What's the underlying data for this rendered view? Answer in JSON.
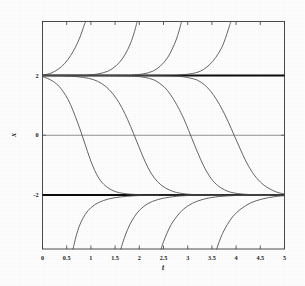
{
  "chart_data": {
    "type": "line",
    "title": "",
    "xlabel": "t",
    "ylabel": "x",
    "xlim": [
      0,
      5
    ],
    "ylim": [
      -3.8,
      3.8
    ],
    "grid": false,
    "legend": "none",
    "x_ticks": [
      0,
      0.5,
      1,
      1.5,
      2,
      2.5,
      3,
      3.5,
      4,
      4.5,
      5
    ],
    "x_tick_labels": [
      "0",
      "0.5",
      "1",
      "1.5",
      "2",
      "2.5",
      "3",
      "3.5",
      "4",
      "4.5",
      "5"
    ],
    "y_ticks": [
      2,
      0,
      -2
    ],
    "y_tick_labels": [
      "2",
      "0",
      "-2"
    ],
    "annotations": [
      {
        "name": "upper-asymptote",
        "y": 2,
        "style": "thick-solid"
      },
      {
        "name": "lower-asymptote",
        "y": -2,
        "style": "thick-solid"
      },
      {
        "name": "zero-axis",
        "y": 0,
        "style": "thin-solid"
      }
    ],
    "series": [
      {
        "name": "descending-sigmoid-1",
        "region": "between-asymptotes",
        "points": [
          [
            0.0,
            1.96
          ],
          [
            0.1,
            1.9
          ],
          [
            0.22,
            1.8
          ],
          [
            0.35,
            1.62
          ],
          [
            0.48,
            1.33
          ],
          [
            0.58,
            1.02
          ],
          [
            0.68,
            0.62
          ],
          [
            0.78,
            0.18
          ],
          [
            0.88,
            -0.3
          ],
          [
            0.98,
            -0.78
          ],
          [
            1.08,
            -1.18
          ],
          [
            1.2,
            -1.52
          ],
          [
            1.34,
            -1.74
          ],
          [
            1.5,
            -1.88
          ],
          [
            1.7,
            -1.95
          ],
          [
            1.95,
            -1.98
          ],
          [
            2.3,
            -2.0
          ],
          [
            3.0,
            -2.0
          ],
          [
            5.0,
            -2.0
          ]
        ]
      },
      {
        "name": "descending-sigmoid-2",
        "region": "between-asymptotes",
        "points": [
          [
            0.0,
            2.0
          ],
          [
            0.3,
            1.99
          ],
          [
            0.6,
            1.97
          ],
          [
            0.85,
            1.93
          ],
          [
            1.05,
            1.86
          ],
          [
            1.22,
            1.73
          ],
          [
            1.38,
            1.52
          ],
          [
            1.52,
            1.24
          ],
          [
            1.64,
            0.92
          ],
          [
            1.76,
            0.52
          ],
          [
            1.88,
            0.06
          ],
          [
            2.0,
            -0.42
          ],
          [
            2.12,
            -0.88
          ],
          [
            2.24,
            -1.26
          ],
          [
            2.38,
            -1.56
          ],
          [
            2.54,
            -1.76
          ],
          [
            2.72,
            -1.89
          ],
          [
            2.95,
            -1.96
          ],
          [
            3.25,
            -1.99
          ],
          [
            3.8,
            -2.0
          ],
          [
            5.0,
            -2.0
          ]
        ]
      },
      {
        "name": "descending-sigmoid-3",
        "region": "between-asymptotes",
        "points": [
          [
            0.0,
            2.0
          ],
          [
            0.8,
            2.0
          ],
          [
            1.5,
            1.99
          ],
          [
            1.9,
            1.97
          ],
          [
            2.12,
            1.93
          ],
          [
            2.3,
            1.85
          ],
          [
            2.45,
            1.7
          ],
          [
            2.58,
            1.5
          ],
          [
            2.7,
            1.22
          ],
          [
            2.8,
            0.94
          ],
          [
            2.92,
            0.55
          ],
          [
            3.02,
            0.16
          ],
          [
            3.14,
            -0.32
          ],
          [
            3.26,
            -0.78
          ],
          [
            3.38,
            -1.18
          ],
          [
            3.52,
            -1.52
          ],
          [
            3.68,
            -1.75
          ],
          [
            3.86,
            -1.89
          ],
          [
            4.1,
            -1.96
          ],
          [
            4.45,
            -1.99
          ],
          [
            5.0,
            -2.0
          ]
        ]
      },
      {
        "name": "descending-sigmoid-4",
        "region": "between-asymptotes",
        "points": [
          [
            0.0,
            2.0
          ],
          [
            1.6,
            2.0
          ],
          [
            2.4,
            1.99
          ],
          [
            2.8,
            1.97
          ],
          [
            3.02,
            1.92
          ],
          [
            3.2,
            1.84
          ],
          [
            3.35,
            1.68
          ],
          [
            3.48,
            1.46
          ],
          [
            3.6,
            1.18
          ],
          [
            3.72,
            0.84
          ],
          [
            3.84,
            0.44
          ],
          [
            3.96,
            0.0
          ],
          [
            4.08,
            -0.44
          ],
          [
            4.2,
            -0.86
          ],
          [
            4.34,
            -1.25
          ],
          [
            4.5,
            -1.56
          ],
          [
            4.66,
            -1.76
          ],
          [
            4.84,
            -1.9
          ],
          [
            5.0,
            -1.96
          ]
        ]
      },
      {
        "name": "upper-branch-1",
        "region": "above-upper-asymptote",
        "points": [
          [
            0.05,
            2.02
          ],
          [
            0.18,
            2.08
          ],
          [
            0.32,
            2.2
          ],
          [
            0.46,
            2.4
          ],
          [
            0.58,
            2.66
          ],
          [
            0.68,
            2.94
          ],
          [
            0.76,
            3.22
          ],
          [
            0.82,
            3.48
          ],
          [
            0.87,
            3.72
          ],
          [
            0.9,
            3.8
          ]
        ]
      },
      {
        "name": "upper-branch-2",
        "region": "above-upper-asymptote",
        "points": [
          [
            0.95,
            2.01
          ],
          [
            1.15,
            2.05
          ],
          [
            1.35,
            2.14
          ],
          [
            1.52,
            2.32
          ],
          [
            1.66,
            2.58
          ],
          [
            1.76,
            2.86
          ],
          [
            1.84,
            3.16
          ],
          [
            1.9,
            3.46
          ],
          [
            1.94,
            3.7
          ],
          [
            1.96,
            3.8
          ]
        ]
      },
      {
        "name": "upper-branch-3",
        "region": "above-upper-asymptote",
        "points": [
          [
            1.85,
            2.01
          ],
          [
            2.08,
            2.05
          ],
          [
            2.28,
            2.14
          ],
          [
            2.44,
            2.32
          ],
          [
            2.58,
            2.58
          ],
          [
            2.68,
            2.88
          ],
          [
            2.76,
            3.18
          ],
          [
            2.82,
            3.48
          ],
          [
            2.86,
            3.72
          ],
          [
            2.88,
            3.8
          ]
        ]
      },
      {
        "name": "upper-branch-4",
        "region": "above-upper-asymptote",
        "points": [
          [
            2.8,
            2.01
          ],
          [
            3.05,
            2.05
          ],
          [
            3.26,
            2.14
          ],
          [
            3.44,
            2.34
          ],
          [
            3.58,
            2.6
          ],
          [
            3.7,
            2.92
          ],
          [
            3.78,
            3.24
          ],
          [
            3.84,
            3.54
          ],
          [
            3.88,
            3.74
          ],
          [
            3.9,
            3.8
          ]
        ]
      },
      {
        "name": "lower-branch-1",
        "region": "below-lower-asymptote",
        "points": [
          [
            0.63,
            -3.8
          ],
          [
            0.66,
            -3.6
          ],
          [
            0.7,
            -3.34
          ],
          [
            0.76,
            -3.04
          ],
          [
            0.84,
            -2.76
          ],
          [
            0.94,
            -2.52
          ],
          [
            1.08,
            -2.32
          ],
          [
            1.26,
            -2.18
          ],
          [
            1.48,
            -2.09
          ],
          [
            1.74,
            -2.04
          ],
          [
            2.05,
            -2.01
          ],
          [
            2.4,
            -2.0
          ]
        ]
      },
      {
        "name": "lower-branch-2",
        "region": "below-lower-asymptote",
        "points": [
          [
            1.62,
            -3.8
          ],
          [
            1.66,
            -3.58
          ],
          [
            1.72,
            -3.3
          ],
          [
            1.8,
            -3.0
          ],
          [
            1.9,
            -2.72
          ],
          [
            2.02,
            -2.48
          ],
          [
            2.18,
            -2.28
          ],
          [
            2.38,
            -2.15
          ],
          [
            2.62,
            -2.07
          ],
          [
            2.92,
            -2.02
          ],
          [
            3.3,
            -2.0
          ],
          [
            3.7,
            -2.0
          ]
        ]
      },
      {
        "name": "lower-branch-3",
        "region": "below-lower-asymptote",
        "points": [
          [
            2.45,
            -3.8
          ],
          [
            2.5,
            -3.56
          ],
          [
            2.57,
            -3.28
          ],
          [
            2.66,
            -2.98
          ],
          [
            2.78,
            -2.7
          ],
          [
            2.92,
            -2.46
          ],
          [
            3.1,
            -2.27
          ],
          [
            3.32,
            -2.14
          ],
          [
            3.58,
            -2.06
          ],
          [
            3.9,
            -2.02
          ],
          [
            4.3,
            -2.0
          ],
          [
            4.7,
            -2.0
          ]
        ]
      },
      {
        "name": "lower-branch-4",
        "region": "below-lower-asymptote",
        "points": [
          [
            3.6,
            -3.8
          ],
          [
            3.65,
            -3.56
          ],
          [
            3.72,
            -3.28
          ],
          [
            3.82,
            -2.98
          ],
          [
            3.94,
            -2.7
          ],
          [
            4.1,
            -2.46
          ],
          [
            4.3,
            -2.26
          ],
          [
            4.54,
            -2.13
          ],
          [
            4.8,
            -2.05
          ],
          [
            5.0,
            -2.02
          ]
        ]
      }
    ]
  },
  "figure": {
    "background_color": "#fefefe",
    "axis_color": "#3a3a3a",
    "curve_color": "#4a4a4a",
    "asymptote_color": "#0d0d0d",
    "zeroline_color": "#6e6e6e"
  }
}
